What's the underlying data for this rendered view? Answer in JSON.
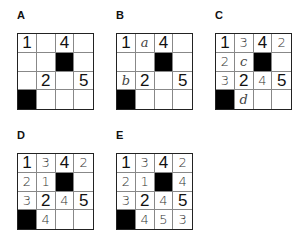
{
  "panels": [
    {
      "label": "A",
      "cells": [
        [
          {
            "v": "1",
            "t": "given"
          },
          {
            "v": "",
            "t": "empty"
          },
          {
            "v": "4",
            "t": "given"
          },
          {
            "v": "",
            "t": "empty"
          }
        ],
        [
          {
            "v": "",
            "t": "empty"
          },
          {
            "v": "",
            "t": "empty"
          },
          {
            "v": "",
            "t": "black"
          },
          {
            "v": "",
            "t": "empty"
          }
        ],
        [
          {
            "v": "",
            "t": "empty"
          },
          {
            "v": "2",
            "t": "given"
          },
          {
            "v": "",
            "t": "empty"
          },
          {
            "v": "5",
            "t": "given"
          }
        ],
        [
          {
            "v": "",
            "t": "black"
          },
          {
            "v": "",
            "t": "empty"
          },
          {
            "v": "",
            "t": "empty"
          },
          {
            "v": "",
            "t": "empty"
          }
        ]
      ]
    },
    {
      "label": "B",
      "cells": [
        [
          {
            "v": "1",
            "t": "given"
          },
          {
            "v": "a",
            "t": "letter"
          },
          {
            "v": "4",
            "t": "given"
          },
          {
            "v": "",
            "t": "empty"
          }
        ],
        [
          {
            "v": "",
            "t": "empty"
          },
          {
            "v": "",
            "t": "empty"
          },
          {
            "v": "",
            "t": "black"
          },
          {
            "v": "",
            "t": "empty"
          }
        ],
        [
          {
            "v": "b",
            "t": "letter"
          },
          {
            "v": "2",
            "t": "given"
          },
          {
            "v": "",
            "t": "empty"
          },
          {
            "v": "5",
            "t": "given"
          }
        ],
        [
          {
            "v": "",
            "t": "black"
          },
          {
            "v": "",
            "t": "empty"
          },
          {
            "v": "",
            "t": "empty"
          },
          {
            "v": "",
            "t": "empty"
          }
        ]
      ]
    },
    {
      "label": "C",
      "cells": [
        [
          {
            "v": "1",
            "t": "given"
          },
          {
            "v": "3",
            "t": "hand"
          },
          {
            "v": "4",
            "t": "given"
          },
          {
            "v": "2",
            "t": "hand"
          }
        ],
        [
          {
            "v": "2",
            "t": "hand"
          },
          {
            "v": "c",
            "t": "letter"
          },
          {
            "v": "",
            "t": "black"
          },
          {
            "v": "",
            "t": "empty"
          }
        ],
        [
          {
            "v": "3",
            "t": "hand"
          },
          {
            "v": "2",
            "t": "given"
          },
          {
            "v": "4",
            "t": "hand"
          },
          {
            "v": "5",
            "t": "given"
          }
        ],
        [
          {
            "v": "",
            "t": "black"
          },
          {
            "v": "d",
            "t": "letter"
          },
          {
            "v": "",
            "t": "empty"
          },
          {
            "v": "",
            "t": "empty"
          }
        ]
      ]
    },
    {
      "label": "D",
      "cells": [
        [
          {
            "v": "1",
            "t": "given"
          },
          {
            "v": "3",
            "t": "hand"
          },
          {
            "v": "4",
            "t": "given"
          },
          {
            "v": "2",
            "t": "hand"
          }
        ],
        [
          {
            "v": "2",
            "t": "hand"
          },
          {
            "v": "1",
            "t": "hand"
          },
          {
            "v": "",
            "t": "black"
          },
          {
            "v": "",
            "t": "empty"
          }
        ],
        [
          {
            "v": "3",
            "t": "hand"
          },
          {
            "v": "2",
            "t": "given"
          },
          {
            "v": "4",
            "t": "hand"
          },
          {
            "v": "5",
            "t": "given"
          }
        ],
        [
          {
            "v": "",
            "t": "black"
          },
          {
            "v": "4",
            "t": "hand"
          },
          {
            "v": "",
            "t": "empty"
          },
          {
            "v": "",
            "t": "empty"
          }
        ]
      ]
    },
    {
      "label": "E",
      "cells": [
        [
          {
            "v": "1",
            "t": "given"
          },
          {
            "v": "3",
            "t": "hand"
          },
          {
            "v": "4",
            "t": "given"
          },
          {
            "v": "2",
            "t": "hand"
          }
        ],
        [
          {
            "v": "2",
            "t": "hand"
          },
          {
            "v": "1",
            "t": "hand"
          },
          {
            "v": "",
            "t": "black"
          },
          {
            "v": "4",
            "t": "hand"
          }
        ],
        [
          {
            "v": "3",
            "t": "hand"
          },
          {
            "v": "2",
            "t": "given"
          },
          {
            "v": "4",
            "t": "hand"
          },
          {
            "v": "5",
            "t": "given"
          }
        ],
        [
          {
            "v": "",
            "t": "black"
          },
          {
            "v": "4",
            "t": "hand"
          },
          {
            "v": "5",
            "t": "hand"
          },
          {
            "v": "3",
            "t": "hand"
          }
        ]
      ]
    }
  ],
  "colors": {
    "black_cell": "#000000",
    "grid_line": "#888888",
    "border": "#222222"
  }
}
